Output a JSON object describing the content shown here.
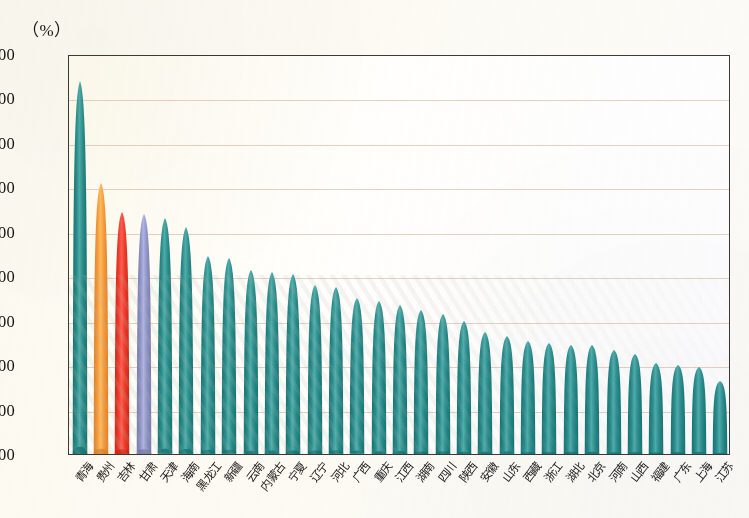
{
  "axis": {
    "unit_label": "（%）",
    "y_ticks": [
      "90.00",
      "80.00",
      "70.00",
      "60.00",
      "50.00",
      "40.00",
      "30.00",
      "20.00",
      "10.00",
      "0.00"
    ]
  },
  "colors": {
    "teal": "#2b8c8c",
    "orange": "#f59a3c",
    "red": "#ea3b2c",
    "purple": "#8e93c8",
    "gridline": "#e3c9b6",
    "frame": "#3a3a3a",
    "text": "#141414"
  },
  "chart_data": {
    "type": "bar",
    "title": "",
    "xlabel": "",
    "ylabel": "（%）",
    "ylim": [
      0,
      90
    ],
    "ytick_step": 10,
    "grid": true,
    "legend": "none",
    "categories": [
      "青海",
      "贵州",
      "吉林",
      "甘肃",
      "天津",
      "海南",
      "黑龙江",
      "新疆",
      "云南",
      "内蒙古",
      "宁夏",
      "辽宁",
      "河北",
      "广西",
      "重庆",
      "江西",
      "湖南",
      "四川",
      "陕西",
      "安徽",
      "山东",
      "西藏",
      "浙江",
      "湖北",
      "北京",
      "河南",
      "山西",
      "福建",
      "广东",
      "上海",
      "江苏"
    ],
    "values": [
      84.0,
      61.0,
      54.5,
      54.0,
      53.0,
      51.0,
      44.5,
      44.0,
      41.5,
      41.0,
      40.5,
      38.0,
      37.5,
      35.0,
      34.5,
      33.5,
      32.5,
      31.5,
      30.0,
      27.5,
      26.5,
      25.5,
      25.0,
      24.5,
      24.5,
      23.5,
      22.5,
      20.5,
      20.0,
      19.5,
      16.5
    ],
    "series_colors": [
      "teal",
      "orange",
      "red",
      "purple",
      "teal",
      "teal",
      "teal",
      "teal",
      "teal",
      "teal",
      "teal",
      "teal",
      "teal",
      "teal",
      "teal",
      "teal",
      "teal",
      "teal",
      "teal",
      "teal",
      "teal",
      "teal",
      "teal",
      "teal",
      "teal",
      "teal",
      "teal",
      "teal",
      "teal",
      "teal",
      "teal"
    ]
  }
}
